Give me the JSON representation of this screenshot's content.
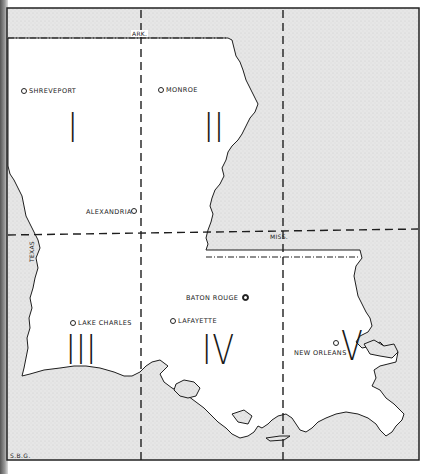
{
  "map": {
    "title": "Louisiana regions map",
    "neighbor_labels": {
      "north": "ARK.",
      "west": "TEXAS",
      "east": "MISS."
    },
    "regions": [
      {
        "numeral": "I"
      },
      {
        "numeral": "II"
      },
      {
        "numeral": "III"
      },
      {
        "numeral": "IV"
      },
      {
        "numeral": "V"
      }
    ],
    "cities": [
      {
        "name": "SHREVEPORT",
        "symbol": "open-circle"
      },
      {
        "name": "MONROE",
        "symbol": "open-circle"
      },
      {
        "name": "ALEXANDRIA",
        "symbol": "open-circle"
      },
      {
        "name": "BATON ROUGE",
        "symbol": "capital-circle"
      },
      {
        "name": "LAKE CHARLES",
        "symbol": "open-circle"
      },
      {
        "name": "LAFAYETTE",
        "symbol": "open-circle"
      },
      {
        "name": "NEW ORLEANS",
        "symbol": "open-circle"
      }
    ],
    "credit": "S.B.G.",
    "colors": {
      "land_fill": "#ffffff",
      "outside_fill": "#e4e4e4",
      "line": "#1e1e1e"
    }
  }
}
